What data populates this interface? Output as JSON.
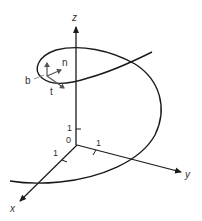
{
  "diagram": {
    "axes": {
      "z_label": "z",
      "y_label": "y",
      "x_label": "x",
      "origin_label": "0",
      "z_tick_label": "1",
      "y_tick_label": "1",
      "x_tick_label": "1"
    },
    "frame_vectors": {
      "binormal": "b",
      "normal": "n",
      "tangent": "t"
    },
    "colors": {
      "line": "#1a1a1a",
      "text": "#333333",
      "background": "#ffffff"
    }
  }
}
